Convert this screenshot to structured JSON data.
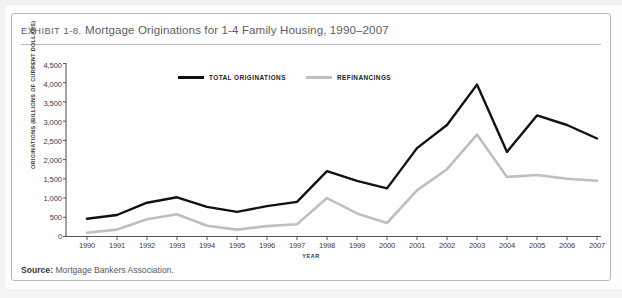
{
  "exhibit": {
    "label": "EXHIBIT",
    "number": "1-8.",
    "title": "Mortgage Originations for 1-4 Family Housing, 1990–2007"
  },
  "source": {
    "prefix": "Source:",
    "text": "Mortgage Bankers Association."
  },
  "legend": {
    "items": [
      {
        "label": "TOTAL ORIGINATIONS",
        "color": "#111111"
      },
      {
        "label": "REFINANCINGS",
        "color": "#bfbfbf"
      }
    ]
  },
  "axes": {
    "y_title": "ORIGINATIONS (BILLIONS OF CURRENT DOLLARS)",
    "x_title": "YEAR",
    "y_ticks": [
      "0",
      "500",
      "1,000",
      "1,500",
      "2,000",
      "2,500",
      "3,000",
      "3,500",
      "4,000",
      "4,500"
    ],
    "x_ticks": [
      "1990",
      "1991",
      "1992",
      "1993",
      "1994",
      "1995",
      "1996",
      "1997",
      "1998",
      "1999",
      "2000",
      "2001",
      "2002",
      "2003",
      "2004",
      "2005",
      "2006",
      "2007"
    ]
  },
  "colors": {
    "total_originations": "#111111",
    "refinancings": "#bfbfbf",
    "axis": "#555555",
    "frame": "#b9b9b9",
    "title_text": "#5e5e5e"
  },
  "chart_data": {
    "type": "line",
    "title": "Mortgage Originations for 1-4 Family Housing, 1990–2007",
    "xlabel": "YEAR",
    "ylabel": "ORIGINATIONS (BILLIONS OF CURRENT DOLLARS)",
    "xlim": [
      1990,
      2007
    ],
    "ylim": [
      0,
      4500
    ],
    "ytick_interval": 500,
    "grid": false,
    "legend_position": "top-center",
    "x": [
      1990,
      1991,
      1992,
      1993,
      1994,
      1995,
      1996,
      1997,
      1998,
      1999,
      2000,
      2001,
      2002,
      2003,
      2004,
      2005,
      2006,
      2007
    ],
    "series": [
      {
        "name": "TOTAL ORIGINATIONS",
        "color": "#111111",
        "values": [
          460,
          560,
          880,
          1020,
          770,
          640,
          790,
          900,
          1700,
          1450,
          1250,
          2300,
          2900,
          3950,
          2200,
          3150,
          2900,
          2550
        ]
      },
      {
        "name": "REFINANCINGS",
        "color": "#bfbfbf",
        "values": [
          100,
          180,
          450,
          580,
          280,
          180,
          270,
          320,
          1000,
          600,
          350,
          1200,
          1750,
          2650,
          1550,
          1600,
          1500,
          1450
        ]
      }
    ]
  }
}
